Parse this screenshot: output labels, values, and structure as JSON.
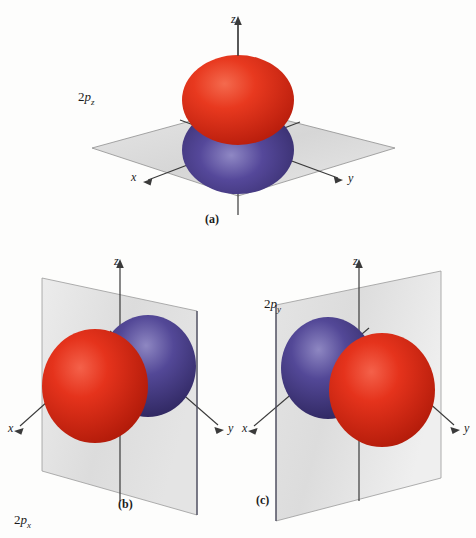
{
  "figure": {
    "background_color": "#fdfdfc",
    "lobe_positive_color": "#e0301a",
    "lobe_negative_color": "#4b3f8c",
    "plane_color": "#d8d8d8",
    "axis_color": "#3a3a3a"
  },
  "panels": [
    {
      "id": "a",
      "caption": "(a)",
      "orbital_prefix": "2",
      "orbital_letter": "p",
      "orbital_subscript": "z",
      "nodal_plane": "xy",
      "axes": [
        {
          "name": "z",
          "label": "z",
          "direction": "up"
        },
        {
          "name": "x",
          "label": "x",
          "direction": "down-left"
        },
        {
          "name": "y",
          "label": "y",
          "direction": "down-right"
        }
      ],
      "lobes": [
        {
          "sign": "positive",
          "color": "#e0301a",
          "position": "above-plane",
          "along": "+z"
        },
        {
          "sign": "negative",
          "color": "#4b3f8c",
          "position": "below-plane",
          "along": "-z"
        }
      ]
    },
    {
      "id": "b",
      "caption": "(b)",
      "orbital_prefix": "2",
      "orbital_letter": "p",
      "orbital_subscript": "x",
      "nodal_plane": "yz",
      "axes": [
        {
          "name": "z",
          "label": "z",
          "direction": "up"
        },
        {
          "name": "x",
          "label": "x",
          "direction": "down-left"
        },
        {
          "name": "y",
          "label": "y",
          "direction": "down-right"
        }
      ],
      "lobes": [
        {
          "sign": "positive",
          "color": "#e0301a",
          "position": "front-left",
          "along": "+x"
        },
        {
          "sign": "negative",
          "color": "#4b3f8c",
          "position": "back-right",
          "along": "-x"
        }
      ]
    },
    {
      "id": "c",
      "caption": "(c)",
      "orbital_prefix": "2",
      "orbital_letter": "p",
      "orbital_subscript": "y",
      "nodal_plane": "xz",
      "axes": [
        {
          "name": "z",
          "label": "z",
          "direction": "up"
        },
        {
          "name": "x",
          "label": "x",
          "direction": "down-left"
        },
        {
          "name": "y",
          "label": "y",
          "direction": "down-right"
        }
      ],
      "lobes": [
        {
          "sign": "negative",
          "color": "#4b3f8c",
          "position": "back-left",
          "along": "-y"
        },
        {
          "sign": "positive",
          "color": "#e0301a",
          "position": "front-right",
          "along": "+y"
        }
      ]
    }
  ]
}
